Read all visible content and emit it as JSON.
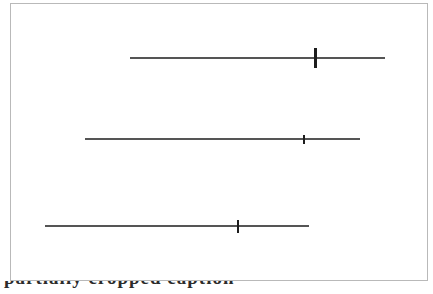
{
  "figure": {
    "frame": {
      "x": 10,
      "y": 3,
      "width": 418,
      "height": 278,
      "border_color": "#b9b9b9"
    },
    "background_color": "#ffffff",
    "line_color": "#555555",
    "marker_color": "#1d1d1d"
  },
  "caption": {
    "text": "partially cropped caption"
  },
  "chart_data": {
    "type": "line",
    "subtype": "interval-plot",
    "title": "",
    "subtitle": "",
    "xlabel": "",
    "ylabel": "",
    "grid": false,
    "legend": null,
    "axis_visible": false,
    "tick_labels": [],
    "categories": [
      "row-1",
      "row-2",
      "row-3"
    ],
    "xlim": [
      10,
      428
    ],
    "ylim": [
      3,
      281
    ],
    "series": [
      {
        "name": "row-1",
        "y": 58,
        "low": 130,
        "high": 385,
        "estimate": 315,
        "marker_height": 20,
        "marker_width": 3,
        "line_thickness": 2
      },
      {
        "name": "row-2",
        "y": 139,
        "low": 85,
        "high": 360,
        "estimate": 304,
        "marker_height": 9,
        "marker_width": 2,
        "line_thickness": 2
      },
      {
        "name": "row-3",
        "y": 226,
        "low": 45,
        "high": 309,
        "estimate": 238,
        "marker_height": 13,
        "marker_width": 2,
        "line_thickness": 2
      }
    ]
  }
}
